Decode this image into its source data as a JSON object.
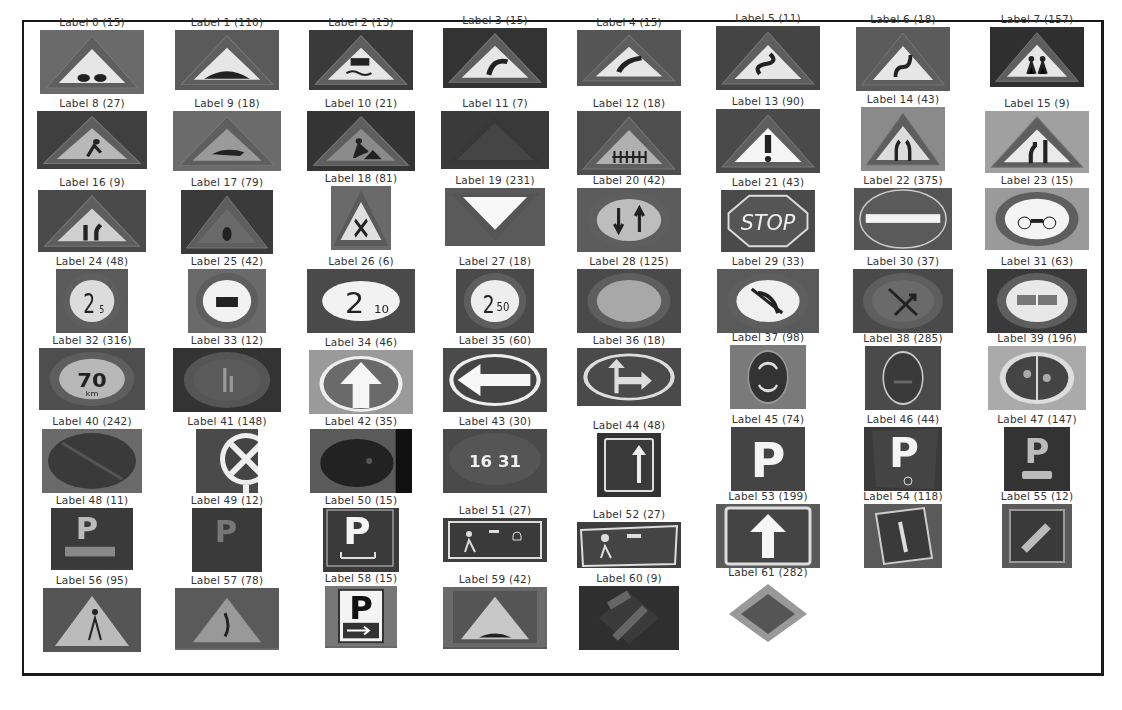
{
  "figure": {
    "tiles": [
      {
        "label": "Label 0 (15)",
        "sign": "tri-bump2",
        "bg": "#6a6a6a",
        "w": 104,
        "h": 64
      },
      {
        "label": "Label 1 (110)",
        "sign": "tri-bump",
        "bg": "#5a5a5a",
        "w": 104,
        "h": 60
      },
      {
        "label": "Label 2 (13)",
        "sign": "tri-slip",
        "bg": "#3a3a3a",
        "w": 104,
        "h": 60
      },
      {
        "label": "Label 3 (15)",
        "sign": "tri-curve-r",
        "bg": "#333333",
        "w": 104,
        "h": 60
      },
      {
        "label": "Label 4 (15)",
        "sign": "tri-curve-l",
        "bg": "#555555",
        "w": 104,
        "h": 56
      },
      {
        "label": "Label 5 (11)",
        "sign": "tri-s",
        "bg": "#444444",
        "w": 104,
        "h": 64
      },
      {
        "label": "Label 6 (18)",
        "sign": "tri-s2",
        "bg": "#5b5b5b",
        "w": 94,
        "h": 64
      },
      {
        "label": "Label 7 (157)",
        "sign": "tri-children",
        "bg": "#2f2f2f",
        "w": 94,
        "h": 60
      },
      {
        "label": "Label 8 (27)",
        "sign": "tri-figure",
        "bg": "#3f3f3f",
        "w": 110,
        "h": 58
      },
      {
        "label": "Label 9 (18)",
        "sign": "tri-animal",
        "bg": "#6b6b6b",
        "w": 108,
        "h": 60
      },
      {
        "label": "Label 10 (21)",
        "sign": "tri-works",
        "bg": "#343434",
        "w": 108,
        "h": 60
      },
      {
        "label": "Label 11 (7)",
        "sign": "tri-plain",
        "bg": "#3a3a3a",
        "w": 108,
        "h": 58
      },
      {
        "label": "Label 12 (18)",
        "sign": "tri-rail",
        "bg": "#4e4e4e",
        "w": 104,
        "h": 64
      },
      {
        "label": "Label 13 (90)",
        "sign": "tri-excl",
        "bg": "#4a4a4a",
        "w": 104,
        "h": 64
      },
      {
        "label": "Label 14 (43)",
        "sign": "tri-narrow",
        "bg": "#8a8a8a",
        "w": 84,
        "h": 64
      },
      {
        "label": "Label 15 (9)",
        "sign": "tri-narrow2",
        "bg": "#a0a0a0",
        "w": 104,
        "h": 62
      },
      {
        "label": "Label 16 (9)",
        "sign": "tri-narrow3",
        "bg": "#4a4a4a",
        "w": 108,
        "h": 62
      },
      {
        "label": "Label 17 (79)",
        "sign": "tri-dark",
        "bg": "#3a3a3a",
        "w": 92,
        "h": 64
      },
      {
        "label": "Label 18 (81)",
        "sign": "tri-x",
        "bg": "#6a6a6a",
        "w": 60,
        "h": 64
      },
      {
        "label": "Label 19 (231)",
        "sign": "yield",
        "bg": "#5a5a5a",
        "w": 100,
        "h": 58
      },
      {
        "label": "Label 20 (42)",
        "sign": "circ-priority",
        "bg": "#5c5c5c",
        "w": 104,
        "h": 64
      },
      {
        "label": "Label 21 (43)",
        "sign": "stop",
        "bg": "#4a4a4a",
        "w": 94,
        "h": 62
      },
      {
        "label": "Label 22 (375)",
        "sign": "no-entry",
        "bg": "#555555",
        "w": 98,
        "h": 62
      },
      {
        "label": "Label 23 (15)",
        "sign": "circ-bike",
        "bg": "#9a9a9a",
        "w": 104,
        "h": 62
      },
      {
        "label": "Label 24 (48)",
        "sign": "circ-25t",
        "bg": "#5a5a5a",
        "w": 72,
        "h": 64
      },
      {
        "label": "Label 25 (42)",
        "sign": "circ-truck",
        "bg": "#6a6a6a",
        "w": 78,
        "h": 64
      },
      {
        "label": "Label 26 (6)",
        "sign": "circ-2m10",
        "bg": "#4a4a4a",
        "w": 108,
        "h": 64
      },
      {
        "label": "Label 27 (18)",
        "sign": "circ-250",
        "bg": "#4a4a4a",
        "w": 78,
        "h": 64
      },
      {
        "label": "Label 28 (125)",
        "sign": "circ-empty",
        "bg": "#4a4a4a",
        "w": 104,
        "h": 64
      },
      {
        "label": "Label 29 (33)",
        "sign": "circ-noleft",
        "bg": "#5a5a5a",
        "w": 102,
        "h": 64
      },
      {
        "label": "Label 30 (37)",
        "sign": "circ-noright",
        "bg": "#4a4a4a",
        "w": 100,
        "h": 64
      },
      {
        "label": "Label 31 (63)",
        "sign": "circ-nopass",
        "bg": "#3a3a3a",
        "w": 100,
        "h": 64
      },
      {
        "label": "Label 32 (316)",
        "sign": "circ-70",
        "bg": "#4e4e4e",
        "w": 106,
        "h": 62
      },
      {
        "label": "Label 33 (12)",
        "sign": "circ-dim",
        "bg": "#333333",
        "w": 108,
        "h": 64
      },
      {
        "label": "Label 34 (46)",
        "sign": "circ-up",
        "bg": "#9a9a9a",
        "w": 104,
        "h": 64
      },
      {
        "label": "Label 35 (60)",
        "sign": "circ-left",
        "bg": "#4a4a4a",
        "w": 104,
        "h": 64
      },
      {
        "label": "Label 36 (18)",
        "sign": "circ-upright",
        "bg": "#4a4a4a",
        "w": 104,
        "h": 58
      },
      {
        "label": "Label 37 (98)",
        "sign": "circ-round",
        "bg": "#7a7a7a",
        "w": 76,
        "h": 64
      },
      {
        "label": "Label 38 (285)",
        "sign": "circ-bikeb",
        "bg": "#4a4a4a",
        "w": 76,
        "h": 64
      },
      {
        "label": "Label 39 (196)",
        "sign": "circ-ped",
        "bg": "#aaaaaa",
        "w": 98,
        "h": 64
      },
      {
        "label": "Label 40 (242)",
        "sign": "circ-noparking",
        "bg": "#6a6a6a",
        "w": 100,
        "h": 64
      },
      {
        "label": "Label 41 (148)",
        "sign": "circ-x",
        "bg": "#4a4a4a",
        "w": 62,
        "h": 64
      },
      {
        "label": "Label 42 (35)",
        "sign": "circ-dark",
        "bg": "#5a5a5a",
        "w": 102,
        "h": 64
      },
      {
        "label": "Label 43 (30)",
        "sign": "circ-1631",
        "bg": "#4a4a4a",
        "w": 104,
        "h": 64
      },
      {
        "label": "Label 44 (48)",
        "sign": "sq-up",
        "bg": "#333333",
        "w": 64,
        "h": 64
      },
      {
        "label": "Label 45 (74)",
        "sign": "sq-p",
        "bg": "#4a4a4a",
        "w": 74,
        "h": 64
      },
      {
        "label": "Label 46 (44)",
        "sign": "sq-p-disabled",
        "bg": "#3a3a3a",
        "w": 78,
        "h": 64
      },
      {
        "label": "Label 47 (147)",
        "sign": "sq-p-car",
        "bg": "#333333",
        "w": 66,
        "h": 64
      },
      {
        "label": "Label 48 (11)",
        "sign": "sq-p-truck",
        "bg": "#3e3e3e",
        "w": 82,
        "h": 62
      },
      {
        "label": "Label 49 (12)",
        "sign": "sq-p-tilt",
        "bg": "#3a3a3a",
        "w": 70,
        "h": 64
      },
      {
        "label": "Label 50 (15)",
        "sign": "sq-p-bed",
        "bg": "#3a3a3a",
        "w": 76,
        "h": 64
      },
      {
        "label": "Label 51 (27)",
        "sign": "rect-zone",
        "bg": "#3e3e3e",
        "w": 104,
        "h": 44
      },
      {
        "label": "Label 52 (27)",
        "sign": "rect-zone2",
        "bg": "#3e3e3e",
        "w": 104,
        "h": 46
      },
      {
        "label": "Label 53 (199)",
        "sign": "sq-up-big",
        "bg": "#5a5a5a",
        "w": 104,
        "h": 64
      },
      {
        "label": "Label 54 (118)",
        "sign": "sq-oneway",
        "bg": "#5a5a5a",
        "w": 78,
        "h": 64
      },
      {
        "label": "Label 55 (12)",
        "sign": "sq-tilt",
        "bg": "#5a5a5a",
        "w": 70,
        "h": 64
      },
      {
        "label": "Label 56 (95)",
        "sign": "sq-ped",
        "bg": "#5a5a5a",
        "w": 98,
        "h": 64
      },
      {
        "label": "Label 57 (78)",
        "sign": "sq-ped2",
        "bg": "#6a6a6a",
        "w": 104,
        "h": 62
      },
      {
        "label": "Label 58 (15)",
        "sign": "rect-p-arrow",
        "bg": "#6a6a6a",
        "w": 72,
        "h": 62
      },
      {
        "label": "Label 59 (42)",
        "sign": "sq-bump",
        "bg": "#5a5a5a",
        "w": 104,
        "h": 62
      },
      {
        "label": "Label 60 (9)",
        "sign": "diamond-end",
        "bg": "#333333",
        "w": 100,
        "h": 64
      },
      {
        "label": "Label 61 (282)",
        "sign": "diamond",
        "bg": "#ffffff",
        "w": 94,
        "h": 64
      }
    ]
  }
}
